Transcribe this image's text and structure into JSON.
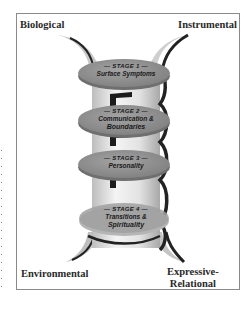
{
  "corners": {
    "top_left": "Biological",
    "top_right": "Instrumental",
    "bottom_left": "Environmental",
    "bottom_right_line1": "Expressive-",
    "bottom_right_line2": "Relational"
  },
  "stages": [
    {
      "number": "— STAGE 1 —",
      "title": "Surface Symptoms",
      "title2": ""
    },
    {
      "number": "— STAGE 2 —",
      "title": "Communication &",
      "title2": "Boundaries"
    },
    {
      "number": "— STAGE 3 —",
      "title": "Personality",
      "title2": ""
    },
    {
      "number": "— STAGE 4 —",
      "title": "Transitions &",
      "title2": "Spirituality"
    }
  ],
  "colors": {
    "disc_fill": "#8c8c8c",
    "disc_top": "#9b9b9b",
    "column_light": "#e6e6e6",
    "column_shadow": "#2a2a2a",
    "frame": "#8a8a8a"
  }
}
